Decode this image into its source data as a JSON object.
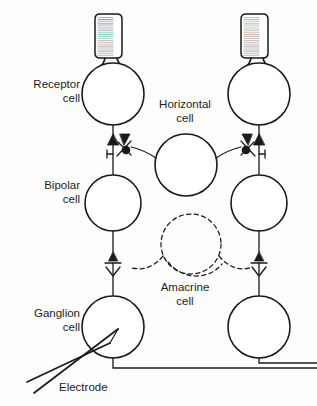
{
  "figure": {
    "background_color": "#fdfdfc",
    "ink_color": "#1a1a1a",
    "width": 317,
    "height": 406
  },
  "labels": {
    "receptor": "Receptor\ncell",
    "bipolar": "Bipolar\ncell",
    "ganglion": "Ganglion\ncell",
    "horizontal": "Horizontal\ncell",
    "amacrine": "Amacrine\ncell",
    "electrode": "Electrode"
  },
  "cells": [
    {
      "name": "receptor-cell-left",
      "type": "receptor",
      "cx": 113,
      "cy": 94,
      "r": 31,
      "outline": "solid"
    },
    {
      "name": "receptor-cell-right",
      "type": "receptor",
      "cx": 259,
      "cy": 94,
      "r": 31,
      "outline": "solid"
    },
    {
      "name": "horizontal-cell",
      "type": "horizontal",
      "cx": 186,
      "cy": 165,
      "r": 31,
      "outline": "solid"
    },
    {
      "name": "bipolar-cell-left",
      "type": "bipolar",
      "cx": 113,
      "cy": 203,
      "r": 28,
      "outline": "solid"
    },
    {
      "name": "bipolar-cell-right",
      "type": "bipolar",
      "cx": 259,
      "cy": 203,
      "r": 28,
      "outline": "solid"
    },
    {
      "name": "amacrine-cell",
      "type": "amacrine",
      "cx": 191,
      "cy": 244,
      "r": 30,
      "outline": "dashed"
    },
    {
      "name": "ganglion-cell-left",
      "type": "ganglion",
      "cx": 113,
      "cy": 327,
      "r": 31,
      "outline": "solid"
    },
    {
      "name": "ganglion-cell-right",
      "type": "ganglion",
      "cx": 259,
      "cy": 327,
      "r": 31,
      "outline": "solid"
    }
  ],
  "outer_segments": [
    {
      "name": "outer-segment-left",
      "x": 95,
      "y": 12,
      "width": 27,
      "height": 45,
      "stripe_count": 22,
      "stripe_colors": [
        "#b9a8c4",
        "#a59ab8",
        "#c3b7cc",
        "#b0a6c0",
        "#cfc7d6",
        "#bdb4c8",
        "#a8bfc0",
        "#8fd0c2",
        "#7fd8c6",
        "#9ed4c4",
        "#bcc9c6",
        "#c8c3c4",
        "#c0bcbe",
        "#cac6c6",
        "#bdb9bb",
        "#c6c2c3",
        "#b8b4b6",
        "#c2bebf",
        "#cbc7c8",
        "#bfbbbc",
        "#c7c3c4",
        "#bab6b7"
      ]
    },
    {
      "name": "outer-segment-right",
      "x": 241,
      "y": 12,
      "width": 27,
      "height": 45,
      "stripe_count": 22,
      "stripe_colors": [
        "#b6ccae",
        "#a8c8a4",
        "#c2d4bc",
        "#b4cdb0",
        "#cdd8c8",
        "#bfcdbb",
        "#c4c2bd",
        "#cbbfb8",
        "#d2bcb2",
        "#c9bdb8",
        "#c6c1be",
        "#cdc6c4",
        "#c2bcba",
        "#cac4c2",
        "#bebab8",
        "#c7c2c0",
        "#bab5b3",
        "#c3bebc",
        "#ccc7c5",
        "#c0bbb9",
        "#c8c3c1",
        "#bbb6b4"
      ]
    }
  ],
  "synapses": {
    "receptor_to_bipolar": [
      {
        "name": "synapse-triangle-left-outer",
        "shape": "filled-triangle",
        "x": 107,
        "y": 140
      },
      {
        "name": "synapse-triangle-left-inner",
        "shape": "filled-triangle",
        "x": 120,
        "y": 137
      },
      {
        "name": "synapse-dot-left",
        "shape": "filled-dot",
        "x": 125,
        "y": 148
      },
      {
        "name": "synapse-triangle-right-outer",
        "shape": "filled-triangle",
        "x": 265,
        "y": 140
      },
      {
        "name": "synapse-triangle-right-inner",
        "shape": "filled-triangle",
        "x": 252,
        "y": 137
      },
      {
        "name": "synapse-dot-right",
        "shape": "filled-dot",
        "x": 247,
        "y": 148
      }
    ],
    "bipolar_to_ganglion": [
      {
        "name": "synapse-triangle-bipolar-left",
        "shape": "filled-triangle",
        "x": 113,
        "y": 260
      },
      {
        "name": "synapse-triangle-bipolar-right",
        "shape": "filled-triangle",
        "x": 259,
        "y": 260
      }
    ]
  },
  "electrode": {
    "name": "recording-electrode",
    "tip_x": 110,
    "tip_y": 330,
    "tail_x": 36,
    "tail_y": 395,
    "style": "double-line-pipette"
  },
  "axons": [
    {
      "name": "axon-ganglion-left",
      "from_x": 113,
      "from_y": 358,
      "to_x": 317,
      "to_y": 363
    },
    {
      "name": "axon-ganglion-right",
      "from_x": 259,
      "from_y": 358,
      "to_x": 317,
      "to_y": 356
    }
  ]
}
